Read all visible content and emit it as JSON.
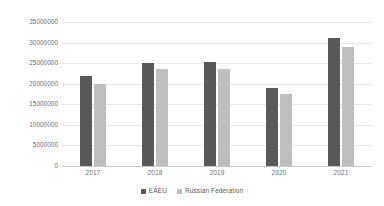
{
  "chart_data": {
    "type": "bar",
    "title": "",
    "subtitle": "",
    "xlabel": "",
    "ylabel": "",
    "categories": [
      "2017",
      "2018",
      "2019",
      "2020",
      "2021"
    ],
    "series": [
      {
        "name": "EAEU",
        "color": "#595959",
        "values": [
          22000000,
          25000000,
          25300000,
          19000000,
          31000000
        ]
      },
      {
        "name": "Russian Federation",
        "color": "#bfbfbf",
        "values": [
          20000000,
          23500000,
          23700000,
          17500000,
          29000000
        ]
      }
    ],
    "ylim": [
      0,
      35000000
    ],
    "ytick_values": [
      0,
      5000000,
      10000000,
      15000000,
      20000000,
      25000000,
      30000000,
      35000000
    ],
    "ytick_labels": [
      "0",
      "5000000",
      "10000000",
      "15000000",
      "20000000",
      "25000000",
      "30000000",
      "35000000"
    ],
    "grid": true,
    "grid_axis": "y",
    "legend": true,
    "legend_position": "bottom"
  }
}
